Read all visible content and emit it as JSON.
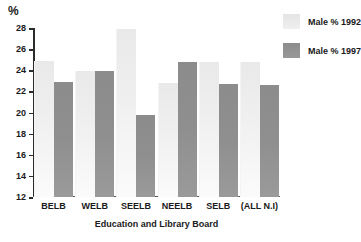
{
  "chart_data": {
    "type": "bar",
    "title": "",
    "categories": [
      "BELB",
      "WELB",
      "SEELB",
      "NEELB",
      "SELB",
      "(ALL N.I)"
    ],
    "series": [
      {
        "name": "Male % 1992",
        "color": "#ececec",
        "values": [
          24.9,
          23.9,
          27.9,
          22.8,
          24.8,
          24.75
        ]
      },
      {
        "name": "Male % 1997",
        "color": "#8e8e8e",
        "values": [
          22.9,
          23.9,
          19.8,
          24.8,
          22.7,
          22.65
        ]
      }
    ],
    "xlabel": "Education and Library Board",
    "ylabel": "%",
    "ylim": [
      12,
      28
    ],
    "yticks": [
      12,
      14,
      16,
      18,
      20,
      22,
      24,
      26,
      28
    ],
    "grid": false,
    "legend_position": "top-right"
  },
  "axis": {
    "unit_label": "%"
  },
  "legend": {
    "items": [
      {
        "label": "Male % 1992"
      },
      {
        "label": "Male % 1997"
      }
    ]
  }
}
